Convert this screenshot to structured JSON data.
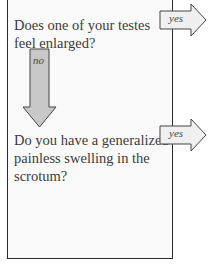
{
  "questions": [
    {
      "text": "Does one of your testes feel enlarged?"
    },
    {
      "text": "Do you have a generalized painless swelling in the scrotum?"
    }
  ],
  "arrows": {
    "yes1": "yes",
    "no1": "no",
    "yes2": "yes"
  },
  "colors": {
    "down_arrow_fill": "#c8c8c8",
    "yes_arrow_fill": "#f0f0f0",
    "border": "#2a2a2a"
  }
}
